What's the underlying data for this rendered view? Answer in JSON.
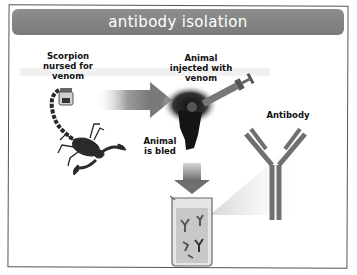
{
  "title": "antibody isolation",
  "labels": {
    "scorpion": "Scorpion\nnursed for\nvenom",
    "animal_injected": "Animal\ninjected with\nvenom",
    "animal_bled": "Animal\nis bled",
    "antibody": "Antibody"
  },
  "icons": [
    "scorpion-icon",
    "venom-jar-icon",
    "arrow-right-icon",
    "animal-icon",
    "syringe-icon",
    "arrow-down-icon",
    "beaker-icon",
    "antibody-icon"
  ],
  "colors": {
    "title_bar": "#858585",
    "title_text": "#ffffff",
    "antibody": "#6e6e6e",
    "arrow": "#8a8a8a",
    "frame": "#555555"
  }
}
